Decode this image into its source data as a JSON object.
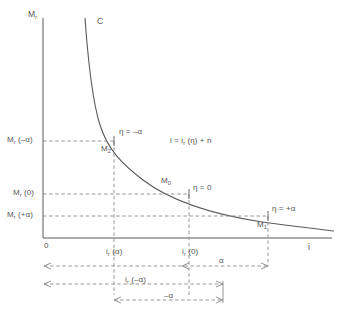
{
  "figure": {
    "type": "xy-diagram",
    "axes": {
      "y_axis_name": "M",
      "y_axis_sub": "r",
      "x_axis_name": "i",
      "origin_label": "0"
    },
    "curve": {
      "label": "C",
      "shape": "decreasing-hyperbolic"
    },
    "equation": {
      "text": "i = i",
      "sub": "r",
      "tail": " (η) + n"
    },
    "y_ticks": [
      {
        "id": "mr-neg-alpha",
        "text": "M",
        "sub": "r",
        "tail": " (–α)",
        "y": 141
      },
      {
        "id": "mr-zero",
        "text": "M",
        "sub": "r",
        "tail": " (0)",
        "y": 194
      },
      {
        "id": "mr-pos-alpha",
        "text": "M",
        "sub": "r",
        "tail": " (+α)",
        "y": 216
      }
    ],
    "x_ticks": [
      {
        "id": "ir-alpha",
        "text": "i",
        "sub": "r",
        "tail": " (α)",
        "x": 111
      },
      {
        "id": "ir-zero",
        "text": "i",
        "sub": "r",
        "tail": " (0)",
        "x": 186
      }
    ],
    "points": [
      {
        "id": "m2",
        "text": "M",
        "sub": "2",
        "eta": "η = –α"
      },
      {
        "id": "m0",
        "text": "M",
        "sub": "0",
        "eta": "η = 0"
      },
      {
        "id": "m1",
        "text": "M",
        "sub": "1",
        "eta": "η = +α"
      }
    ],
    "dimensions": [
      {
        "id": "dim-alpha",
        "text": "α",
        "row": 1
      },
      {
        "id": "dim-ir-neg-alpha",
        "text": "i",
        "sub": "r",
        "tail": " (–α)",
        "row": 2
      },
      {
        "id": "dim-neg-alpha",
        "text": "–α",
        "row": 3
      }
    ],
    "colors": {
      "line": "#5a5a5a",
      "dashed": "#8a8a8a",
      "text": "#555555",
      "background": "#ffffff"
    }
  }
}
